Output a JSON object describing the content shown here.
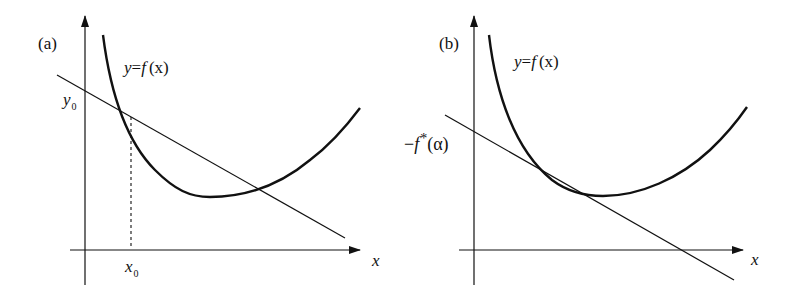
{
  "figure": {
    "panels": [
      {
        "id": "a",
        "label": "(a)",
        "curve_label": {
          "y": "y",
          "eq": "=",
          "f": "f",
          "arg": "(x)"
        },
        "y_intercept_label": {
          "base": "y",
          "sub": "0"
        },
        "x_point_label": {
          "base": "x",
          "sub": "0"
        },
        "x_axis_label": "x",
        "description": "Convex function y=f(x) with a secant line crossing the curve at x0; line meets the y-axis at y0; dashed vertical drop from intersection to x0."
      },
      {
        "id": "b",
        "label": "(b)",
        "curve_label": {
          "y": "y",
          "eq": "=",
          "f": "f",
          "arg": "(x)"
        },
        "y_intercept_label": {
          "minus": "−",
          "f": "f",
          "star": "*",
          "arg": "(α)"
        },
        "x_axis_label": "x",
        "description": "Convex function y=f(x) with a tangent (supporting) line of slope α; its y-intercept is −f*(α)."
      }
    ],
    "colors": {
      "stroke": "#111111",
      "background": "#ffffff"
    }
  }
}
